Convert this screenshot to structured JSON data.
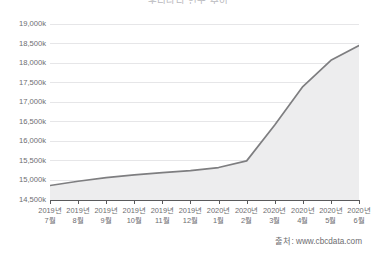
{
  "chart_data": {
    "type": "area",
    "title": "우리나라 인구 추이",
    "xlabel": "",
    "ylabel": "",
    "categories": [
      "2019년 7월",
      "2019년 8월",
      "2019년 9월",
      "2019년 10월",
      "2019년 11월",
      "2019년 12월",
      "2020년 1월",
      "2020년 2월",
      "2020년 3월",
      "2020년 4월",
      "2020년 5월",
      "2020년 6월"
    ],
    "category_lines": [
      [
        "2019년",
        "7월"
      ],
      [
        "2019년",
        "8월"
      ],
      [
        "2019년",
        "9월"
      ],
      [
        "2019년",
        "10월"
      ],
      [
        "2019년",
        "11월"
      ],
      [
        "2019년",
        "12월"
      ],
      [
        "2020년",
        "1월"
      ],
      [
        "2020년",
        "2월"
      ],
      [
        "2020년",
        "3월"
      ],
      [
        "2020년",
        "4월"
      ],
      [
        "2020년",
        "5월"
      ],
      [
        "2020년",
        "6월"
      ]
    ],
    "values": [
      14870,
      14980,
      15070,
      15140,
      15200,
      15250,
      15330,
      15500,
      16420,
      17400,
      18070,
      18450
    ],
    "ylim": [
      14500,
      19000
    ],
    "ytick_values": [
      14500,
      15000,
      15500,
      16000,
      16500,
      17000,
      17500,
      18000,
      18500,
      19000
    ],
    "ytick_labels": [
      "14,500k",
      "15,000k",
      "15,500k",
      "16,000k",
      "16,500k",
      "17,000k",
      "17,500k",
      "18,000k",
      "18,500k",
      "19,000k"
    ],
    "grid": true,
    "legend": false,
    "series_name": "인구",
    "line_color": "#7e7e80",
    "fill_color": "#ededee",
    "grid_color": "#e6e6e8",
    "axis_color": "#59595b"
  },
  "source": {
    "label": "출처: www.cbcdata.com"
  }
}
